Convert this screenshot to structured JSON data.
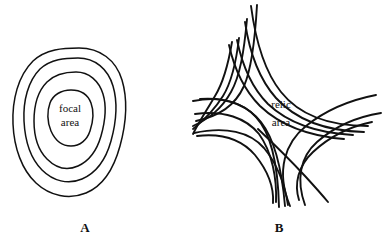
{
  "figure": {
    "background_color": "#ffffff",
    "ink_color": "#111111",
    "width": 386,
    "height": 243
  },
  "panels": [
    {
      "id": "panel-a",
      "label": "A",
      "label_x": 85,
      "label_y": 232,
      "area_label_line1": "focal",
      "area_label_line2": "area",
      "area_label_x": 70,
      "area_label_line1_y": 112,
      "area_label_line2_y": 126,
      "type": "concentric-contours",
      "contour_count": 4,
      "contours": [
        {
          "name": "outermost-contour",
          "stroke_width": 1.6,
          "path": "M 79 48 C 100 48 116 60 122 80 C 128 100 126 124 120 146 C 114 168 103 186 86 193 C 69 200 50 196 36 183 C 22 170 14 148 13 124 C 12 100 18 76 33 61 C 46 49 63 48 79 48 Z"
        },
        {
          "name": "second-contour",
          "stroke_width": 1.6,
          "path": "M 78 58 C 95 58 108 69 113 86 C 118 103 116 123 111 141 C 106 159 96 173 82 179 C 68 185 53 181 42 170 C 31 159 25 141 24 121 C 23 101 28 81 40 69 C 51 59 65 58 78 58 Z"
        },
        {
          "name": "third-contour",
          "stroke_width": 1.6,
          "path": "M 76 72 C 89 72 99 81 103 94 C 107 107 105 122 101 136 C 97 150 89 161 78 166 C 67 171 56 168 47 159 C 38 150 34 136 34 121 C 34 106 38 91 47 82 C 55 74 66 72 76 72 Z"
        },
        {
          "name": "innermost-contour",
          "stroke_width": 1.6,
          "path": "M 71 90 C 81 90 88 95 91 103 C 94 111 93 122 90 131 C 87 140 80 146 71 146 C 62 146 55 140 51 131 C 47 122 47 111 50 103 C 53 95 61 90 71 90 Z"
        }
      ]
    },
    {
      "id": "panel-b",
      "label": "B",
      "label_x": 279,
      "label_y": 232,
      "area_label_line1": "relic",
      "area_label_line2": "area",
      "area_label_x": 281,
      "area_label_line1_y": 108,
      "area_label_line2_y": 126,
      "type": "isogloss-bundles",
      "bundle_count": 3,
      "bundles": [
        {
          "name": "north-to-west-bundle",
          "line_count": 4,
          "lines": [
            {
              "name": "isogloss-nw-1",
              "stroke_width": 1.9,
              "path": "M 257 5 C 255 40 252 68 244 86 C 235 106 219 116 196 121"
            },
            {
              "name": "isogloss-nw-2",
              "stroke_width": 1.9,
              "path": "M 247 19 C 244 52 240 76 231 92 C 221 110 208 119 193 126"
            },
            {
              "name": "isogloss-nw-3",
              "stroke_width": 1.9,
              "path": "M 239 38 C 236 64 231 83 223 96 C 213 112 203 121 193 129"
            },
            {
              "name": "isogloss-nw-4",
              "stroke_width": 1.9,
              "path": "M 232 42 C 228 66 223 83 215 96 C 207 110 200 120 193 134"
            }
          ]
        },
        {
          "name": "north-to-east-bundle",
          "line_count": 4,
          "lines": [
            {
              "name": "isogloss-ne-1",
              "stroke_width": 1.9,
              "path": "M 251 6 C 256 44 265 72 281 92 C 300 116 330 126 368 126"
            },
            {
              "name": "isogloss-ne-2",
              "stroke_width": 1.9,
              "path": "M 245 22 C 250 56 260 80 276 98 C 296 120 326 131 364 132"
            },
            {
              "name": "isogloss-ne-3",
              "stroke_width": 1.9,
              "path": "M 237 40 C 243 69 253 89 268 104 C 288 123 317 133 353 135"
            },
            {
              "name": "isogloss-ne-4",
              "stroke_width": 1.9,
              "path": "M 229 45 C 235 72 245 91 260 106 C 280 125 307 136 344 139"
            }
          ]
        },
        {
          "name": "west-to-south-bundle",
          "line_count": 5,
          "lines": [
            {
              "name": "isogloss-ws-1",
              "stroke_width": 1.9,
              "path": "M 193 101 C 220 96 242 102 256 117 C 272 134 278 165 279 207"
            },
            {
              "name": "isogloss-ws-2",
              "stroke_width": 1.9,
              "path": "M 200 99 C 228 97 248 106 261 122 C 276 141 282 171 285 206"
            },
            {
              "name": "isogloss-ws-3",
              "stroke_width": 1.9,
              "path": "M 195 114 C 224 110 246 118 259 134 C 272 152 277 178 276 202"
            },
            {
              "name": "isogloss-ws-4",
              "stroke_width": 1.9,
              "path": "M 194 133 C 226 126 250 132 264 148 C 278 165 285 186 288 205"
            },
            {
              "name": "isogloss-ws-5",
              "stroke_width": 1.9,
              "path": "M 197 136 C 222 133 242 140 255 155 C 268 171 274 188 273 203"
            }
          ]
        },
        {
          "name": "east-crossing-bundle",
          "line_count": 4,
          "lines": [
            {
              "name": "isogloss-ec-1",
              "stroke_width": 1.9,
              "path": "M 376 95 C 350 100 326 110 306 126 C 286 142 275 170 290 206"
            },
            {
              "name": "isogloss-ec-2",
              "stroke_width": 1.9,
              "path": "M 381 113 C 356 117 334 127 317 142 C 300 157 296 180 305 205"
            },
            {
              "name": "isogloss-ec-3",
              "stroke_width": 1.9,
              "path": "M 372 122 C 348 127 328 138 313 152 C 298 166 294 184 299 200"
            },
            {
              "name": "isogloss-ec-4",
              "stroke_width": 1.9,
              "path": "M 258 129 C 276 146 292 162 305 176 C 316 188 323 196 328 202"
            }
          ]
        }
      ]
    }
  ]
}
